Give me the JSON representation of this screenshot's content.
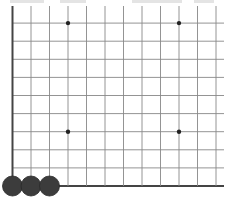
{
  "board": {
    "type": "go-board-partial",
    "line_color": "#555555",
    "border_color": "#444444",
    "background": "#ffffff",
    "origin_x": 12.5,
    "origin_y": 186,
    "spacing_x": 18.5,
    "spacing_y": 18.1,
    "visible_columns": 12,
    "visible_rows": 10,
    "line_extent_right": 224,
    "top_line_y": 6,
    "star_points": [
      {
        "col": 3,
        "row": 9
      },
      {
        "col": 9,
        "row": 9
      },
      {
        "col": 3,
        "row": 3
      },
      {
        "col": 9,
        "row": 3
      }
    ],
    "stones": [
      {
        "col": 0,
        "row": 0,
        "color": "black"
      },
      {
        "col": 1,
        "row": 0,
        "color": "black"
      },
      {
        "col": 2,
        "row": 0,
        "color": "black"
      }
    ],
    "stone_color": "#3c3c3c",
    "stone_radius": 10
  }
}
